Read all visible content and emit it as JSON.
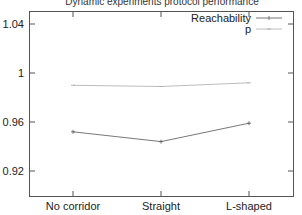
{
  "chart_data": {
    "type": "line",
    "title": "Dynamic experiments protocol performance",
    "xlabel": "",
    "ylabel": "",
    "categories": [
      "No corridor",
      "Straight",
      "L-shaped"
    ],
    "series": [
      {
        "name": "Reachability",
        "values": [
          0.952,
          0.944,
          0.959
        ],
        "color": "#555555"
      },
      {
        "name": "p",
        "values": [
          0.99,
          0.989,
          0.992
        ],
        "color": "#aaaaaa"
      }
    ],
    "yticks": [
      "1.04",
      "1",
      "0.96",
      "0.92"
    ],
    "ytick_values": [
      1.04,
      1.0,
      0.96,
      0.92
    ],
    "ylim": [
      0.9,
      1.05
    ],
    "grid": false,
    "legend_position": "top-right"
  }
}
